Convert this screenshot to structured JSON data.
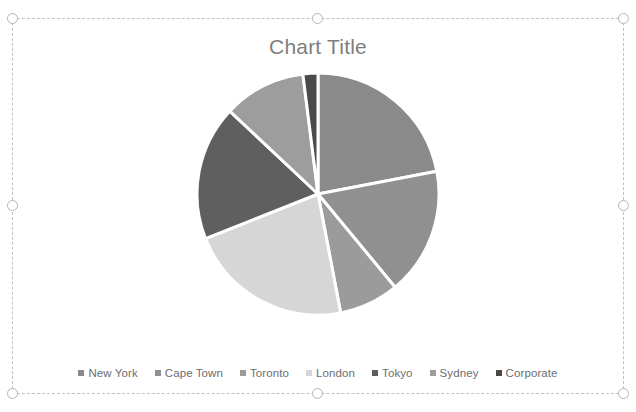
{
  "object": {
    "type_label": "chart-object",
    "selected": true,
    "handles": [
      "top-left",
      "top-center",
      "top-right",
      "middle-left",
      "middle-right",
      "bottom-left",
      "bottom-center",
      "bottom-right"
    ]
  },
  "chart_data": {
    "type": "pie",
    "title": "Chart Title",
    "xlabel": "",
    "ylabel": "",
    "legend_position": "bottom",
    "grid": false,
    "start_angle_deg": 0,
    "direction": "clockwise",
    "categories": [
      "New York",
      "Cape Town",
      "Toronto",
      "London",
      "Tokyo",
      "Sydney",
      "Corporate"
    ],
    "values": [
      22,
      17,
      8,
      22,
      18,
      11,
      2
    ],
    "percentages": [
      22,
      17,
      8,
      22,
      18,
      11,
      2
    ],
    "colors": [
      "#8a8a8a",
      "#909090",
      "#9b9b9b",
      "#d6d6d6",
      "#5f5f5f",
      "#9d9d9d",
      "#4a4a4a"
    ],
    "slice_separator_color": "#ffffff"
  },
  "legend": {
    "items": [
      {
        "label": "New York",
        "color": "#8a8a8a"
      },
      {
        "label": "Cape Town",
        "color": "#909090"
      },
      {
        "label": "Toronto",
        "color": "#9b9b9b"
      },
      {
        "label": "London",
        "color": "#d6d6d6"
      },
      {
        "label": "Tokyo",
        "color": "#5f5f5f"
      },
      {
        "label": "Sydney",
        "color": "#9d9d9d"
      },
      {
        "label": "Corporate",
        "color": "#4a4a4a"
      }
    ]
  },
  "theme": {
    "background": "#ffffff",
    "title_color": "#7e7e7e",
    "legend_text_color": "#6d6d6d",
    "selection_border_color": "#c2c2c2",
    "handle_border_color": "#b4b4b4",
    "handle_fill": "#ffffff"
  }
}
